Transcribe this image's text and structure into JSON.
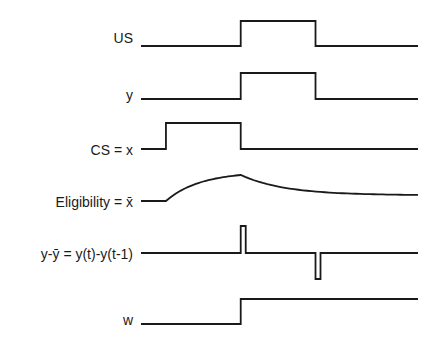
{
  "signals": [
    {
      "id": "us",
      "label": "US",
      "shape": "pulse",
      "on": 0.36,
      "off": 0.63
    },
    {
      "id": "y",
      "label": "y",
      "shape": "pulse",
      "on": 0.36,
      "off": 0.63
    },
    {
      "id": "cs",
      "label": "CS  =  x",
      "shape": "pulse",
      "on": 0.09,
      "off": 0.36
    },
    {
      "id": "elig",
      "label": "Eligibility  =  x̄",
      "shape": "trace",
      "on": 0.09,
      "off": 0.36
    },
    {
      "id": "diff",
      "label": "y-ȳ  =  y(t)-y(t-1)",
      "shape": "spikes",
      "up_at": 0.36,
      "down_at": 0.63
    },
    {
      "id": "w",
      "label": "w",
      "shape": "step",
      "on": 0.36
    }
  ],
  "colors": {
    "line": "#1a1a1a",
    "background": "#ffffff"
  }
}
